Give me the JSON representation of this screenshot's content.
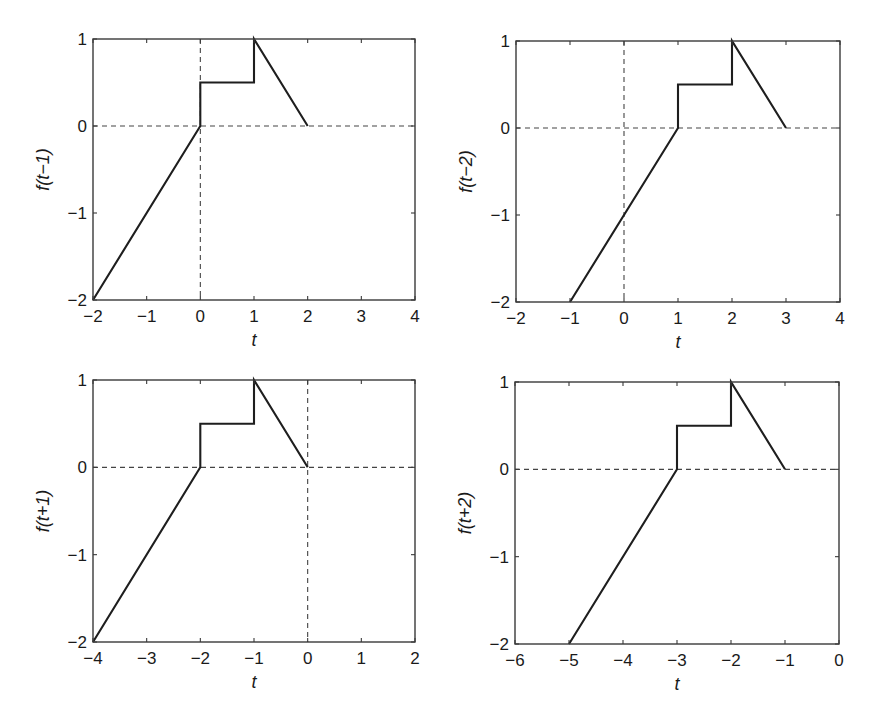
{
  "figure": {
    "line_color": "#1e1e1e",
    "axis_color": "#3a3a3a",
    "ref_line_color": "#444444"
  },
  "chart_data": [
    {
      "type": "line",
      "title": "",
      "xlabel": "t",
      "ylabel": "f(t−1)",
      "xlim": [
        -2,
        4
      ],
      "ylim": [
        -2,
        1
      ],
      "xticks": [
        -2,
        -1,
        0,
        1,
        2,
        3,
        4
      ],
      "xtick_labels": [
        "−2",
        "−1",
        "0",
        "1",
        "2",
        "3",
        "4"
      ],
      "yticks": [
        -2,
        -1,
        0,
        1
      ],
      "ytick_labels": [
        "−2",
        "−1",
        "0",
        "1"
      ],
      "grid": false,
      "reference_lines": {
        "y0_dashed": true,
        "x0_dashed": true
      },
      "series": [
        {
          "name": "f(t−1)",
          "x": [
            -2,
            0,
            0,
            1,
            1,
            2
          ],
          "y": [
            -2,
            0,
            0.5,
            0.5,
            1,
            0
          ]
        }
      ],
      "box": {
        "left": 93,
        "top": 39,
        "right": 415,
        "bottom": 300
      }
    },
    {
      "type": "line",
      "title": "",
      "xlabel": "t",
      "ylabel": "f(t−2)",
      "xlim": [
        -2,
        4
      ],
      "ylim": [
        -2,
        1
      ],
      "xticks": [
        -2,
        -1,
        0,
        1,
        2,
        3,
        4
      ],
      "xtick_labels": [
        "−2",
        "−1",
        "0",
        "1",
        "2",
        "3",
        "4"
      ],
      "yticks": [
        -2,
        -1,
        0,
        1
      ],
      "ytick_labels": [
        "−2",
        "−1",
        "0",
        "1"
      ],
      "grid": false,
      "reference_lines": {
        "y0_dashed": true,
        "x0_dashed": true
      },
      "series": [
        {
          "name": "f(t−2)",
          "x": [
            -1,
            1,
            1,
            2,
            2,
            3
          ],
          "y": [
            -2,
            0,
            0.5,
            0.5,
            1,
            0
          ]
        }
      ],
      "box": {
        "left": 516,
        "top": 41,
        "right": 840,
        "bottom": 302
      }
    },
    {
      "type": "line",
      "title": "",
      "xlabel": "t",
      "ylabel": "f(t+1)",
      "xlim": [
        -4,
        2
      ],
      "ylim": [
        -2,
        1
      ],
      "xticks": [
        -4,
        -3,
        -2,
        -1,
        0,
        1,
        2
      ],
      "xtick_labels": [
        "−4",
        "−3",
        "−2",
        "−1",
        "0",
        "1",
        "2"
      ],
      "yticks": [
        -2,
        -1,
        0,
        1
      ],
      "ytick_labels": [
        "−2",
        "−1",
        "0",
        "1"
      ],
      "grid": false,
      "reference_lines": {
        "y0_dashed": true,
        "x0_dashed": true
      },
      "series": [
        {
          "name": "f(t+1)",
          "x": [
            -4,
            -2,
            -2,
            -1,
            -1,
            0
          ],
          "y": [
            -2,
            0,
            0.5,
            0.5,
            1,
            0
          ]
        }
      ],
      "box": {
        "left": 93,
        "top": 380,
        "right": 415,
        "bottom": 642
      }
    },
    {
      "type": "line",
      "title": "",
      "xlabel": "t",
      "ylabel": "f(t+2)",
      "xlim": [
        -6,
        0
      ],
      "ylim": [
        -2,
        1
      ],
      "xticks": [
        -6,
        -5,
        -4,
        -3,
        -2,
        -1,
        0
      ],
      "xtick_labels": [
        "−6",
        "−5",
        "−4",
        "−3",
        "−2",
        "−1",
        "0"
      ],
      "yticks": [
        -2,
        -1,
        0,
        1
      ],
      "ytick_labels": [
        "−2",
        "−1",
        "0",
        "1"
      ],
      "grid": false,
      "reference_lines": {
        "y0_dashed": true,
        "x0_dashed": false
      },
      "series": [
        {
          "name": "f(t+2)",
          "x": [
            -5,
            -3,
            -3,
            -2,
            -2,
            -1
          ],
          "y": [
            -2,
            0,
            0.5,
            0.5,
            1,
            0
          ]
        }
      ],
      "box": {
        "left": 515,
        "top": 382,
        "right": 839,
        "bottom": 644
      }
    }
  ]
}
